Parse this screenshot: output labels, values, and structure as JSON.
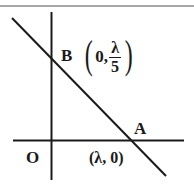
{
  "diagram": {
    "type": "coordinate-geometry",
    "origin_label": "O",
    "points": [
      {
        "id": "B",
        "label": "B",
        "coords_text": {
          "open": "(",
          "x": "0,",
          "y_numerator": "λ",
          "y_denominator": "5",
          "close": ")"
        }
      },
      {
        "id": "A",
        "label": "A",
        "coords_text": "(λ, 0)"
      }
    ],
    "colors": {
      "line": "#1a1a1a",
      "border": "#8a8a8a",
      "background": "#ffffff"
    }
  }
}
